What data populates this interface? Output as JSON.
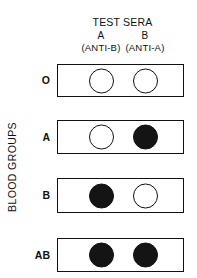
{
  "header": {
    "title": "TEST SERA",
    "columns": [
      {
        "label": "A",
        "sub": "(ANTI-B)"
      },
      {
        "label": "B",
        "sub": "(ANTI-A)"
      }
    ]
  },
  "side_label": "BLOOD GROUPS",
  "rows": [
    {
      "label": "O",
      "results": [
        "no agglutination",
        "no agglutination"
      ]
    },
    {
      "label": "A",
      "results": [
        "no agglutination",
        "agglutination"
      ]
    },
    {
      "label": "B",
      "results": [
        "agglutination",
        "no agglutination"
      ]
    },
    {
      "label": "AB",
      "results": [
        "agglutination",
        "agglutination"
      ]
    }
  ],
  "legend": {
    "open_circle": "no agglutination",
    "filled_circle": "agglutination"
  },
  "colors": {
    "ink": "#111111",
    "background": "#ffffff",
    "filled": "#141414"
  }
}
